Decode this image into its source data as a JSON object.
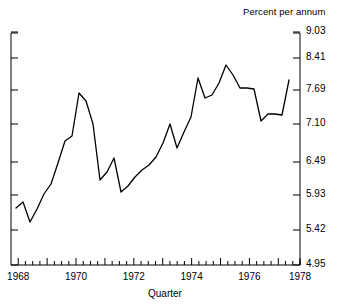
{
  "chart_data": {
    "type": "line",
    "title": "",
    "xlabel": "Quarter",
    "ylabel": "Percent per annum",
    "unit_label": "Percent per annum",
    "grid": false,
    "legend": null,
    "xlim": [
      1967.75,
      1977.75
    ],
    "ylim": [
      4.95,
      9.03
    ],
    "y_scale": "nonlinear-transformed",
    "ytick_labels": [
      "9.03",
      "8.41",
      "7.69",
      "7.10",
      "6.49",
      "5.93",
      "5.42",
      "4.95"
    ],
    "ytick_values": [
      9.03,
      8.41,
      7.69,
      7.1,
      6.49,
      5.93,
      5.42,
      4.95
    ],
    "ytick_pixels": [
      32,
      58,
      90,
      124,
      162,
      195,
      230,
      265
    ],
    "xtick_labels": [
      "1968",
      "1970",
      "1972",
      "1974",
      "1976",
      "1978"
    ],
    "xtick_values": [
      1968,
      1970,
      1972,
      1974,
      1976,
      1978
    ],
    "minor_ticks_per_year": 4,
    "x": [
      1967.75,
      1968.0,
      1968.25,
      1968.5,
      1968.75,
      1969.0,
      1969.25,
      1969.5,
      1969.75,
      1970.0,
      1970.25,
      1970.5,
      1970.75,
      1971.0,
      1971.25,
      1971.5,
      1971.75,
      1972.0,
      1972.25,
      1972.5,
      1972.75,
      1973.0,
      1973.25,
      1973.5,
      1973.75,
      1974.0,
      1974.25,
      1974.5,
      1974.75,
      1975.0,
      1975.25,
      1975.5,
      1975.75,
      1976.0,
      1976.25,
      1976.5,
      1976.75,
      1977.0,
      1977.25,
      1977.5
    ],
    "values": [
      5.66,
      5.76,
      5.5,
      5.87,
      6.14,
      6.35,
      6.74,
      7.2,
      7.31,
      7.69,
      7.55,
      7.1,
      6.1,
      6.2,
      6.49,
      5.93,
      6.02,
      6.18,
      6.3,
      6.38,
      6.52,
      6.8,
      7.2,
      6.75,
      7.1,
      7.45,
      7.9,
      7.6,
      7.55,
      7.8,
      8.2,
      7.95,
      7.7,
      7.7,
      7.68,
      7.2,
      7.38,
      7.38,
      7.36,
      7.86
    ],
    "series": [
      {
        "name": "Quarterly rate",
        "color": "#000000",
        "values": [
          5.66,
          5.76,
          5.5,
          5.87,
          6.14,
          6.35,
          6.74,
          7.2,
          7.31,
          7.69,
          7.55,
          7.1,
          6.1,
          6.2,
          6.49,
          5.93,
          6.02,
          6.18,
          6.3,
          6.38,
          6.52,
          6.8,
          7.2,
          6.75,
          7.1,
          7.45,
          7.9,
          7.6,
          7.55,
          7.8,
          8.2,
          7.95,
          7.7,
          7.7,
          7.68,
          7.2,
          7.38,
          7.38,
          7.36,
          7.86
        ]
      }
    ],
    "line_pixels": [
      [
        16,
        208
      ],
      [
        23,
        202
      ],
      [
        30,
        222
      ],
      [
        37,
        209
      ],
      [
        44,
        194
      ],
      [
        51,
        184
      ],
      [
        58,
        163
      ],
      [
        65,
        141
      ],
      [
        72,
        136
      ],
      [
        79,
        93
      ],
      [
        86,
        101
      ],
      [
        93,
        124
      ],
      [
        100,
        180
      ],
      [
        107,
        172
      ],
      [
        114,
        158
      ],
      [
        121,
        192
      ],
      [
        128,
        186
      ],
      [
        135,
        177
      ],
      [
        142,
        170
      ],
      [
        149,
        165
      ],
      [
        156,
        157
      ],
      [
        163,
        143
      ],
      [
        170,
        124
      ],
      [
        177,
        148
      ],
      [
        184,
        132
      ],
      [
        191,
        117
      ],
      [
        198,
        78
      ],
      [
        205,
        98
      ],
      [
        212,
        95
      ],
      [
        219,
        83
      ],
      [
        226,
        65
      ],
      [
        233,
        75
      ],
      [
        240,
        88
      ],
      [
        247,
        88
      ],
      [
        254,
        89
      ],
      [
        261,
        121
      ],
      [
        268,
        114
      ],
      [
        275,
        114
      ],
      [
        282,
        115
      ],
      [
        289,
        80
      ]
    ]
  },
  "axes": {
    "unit_caption": "Percent per annum",
    "x_axis_title": "Quarter",
    "frame": {
      "left": 11,
      "right": 300,
      "top": 33,
      "bottom": 265
    }
  }
}
